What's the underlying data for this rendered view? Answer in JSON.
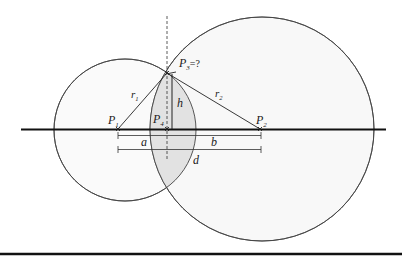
{
  "diagram": {
    "title": "",
    "points": {
      "p1": {
        "label": "P",
        "sub": "1",
        "suffix": ""
      },
      "p2": {
        "label": "P",
        "sub": "2",
        "suffix": ""
      },
      "p3": {
        "label": "P",
        "sub": "3",
        "suffix": "=?"
      },
      "p4": {
        "label": "P",
        "sub": "4",
        "suffix": ""
      }
    },
    "segments": {
      "r1": {
        "label": "r",
        "sub": "1"
      },
      "r2": {
        "label": "r",
        "sub": "2"
      },
      "h": {
        "label": "h"
      },
      "a": {
        "label": "a"
      },
      "b": {
        "label": "b"
      },
      "d": {
        "label": "d"
      }
    },
    "colors": {
      "lens_fill": "#e4e4e4",
      "circle_fill": "#f8f8f8",
      "stroke": "#333333",
      "axis": "#111111"
    }
  }
}
